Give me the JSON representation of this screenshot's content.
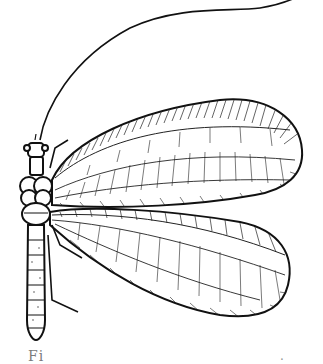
{
  "image": {
    "subject": "Lacewing insect line drawing",
    "style": "black-and-white engraving illustration",
    "background": "#ffffff",
    "ink": "#111111"
  },
  "caption": {
    "left_fragment": "Fi",
    "right_fragment": "."
  }
}
